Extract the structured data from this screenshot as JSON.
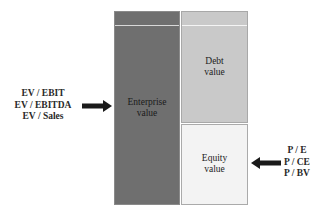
{
  "diagram": {
    "type": "valuation-multiples",
    "boxes": {
      "enterprise": {
        "line1": "Enterprise",
        "line2": "value",
        "color": "#6f6f6f"
      },
      "debt": {
        "line1": "Debt",
        "line2": "value",
        "color": "#c9c9c9"
      },
      "equity": {
        "line1": "Equity",
        "line2": "value",
        "color": "#f3f3f3"
      }
    },
    "left_multiples": [
      "EV / EBIT",
      "EV / EBITDA",
      "EV / Sales"
    ],
    "right_multiples": [
      "P / E",
      "P / CE",
      "P / BV"
    ],
    "arrows": [
      {
        "from": "left_multiples",
        "to": "enterprise",
        "direction": "right"
      },
      {
        "from": "right_multiples",
        "to": "equity",
        "direction": "left"
      }
    ],
    "arrow_color": "#1a1a1a"
  }
}
